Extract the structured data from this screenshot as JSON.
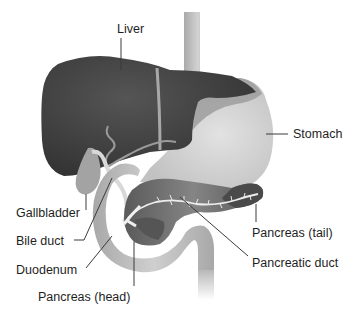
{
  "labels": {
    "liver": "Liver",
    "stomach": "Stomach",
    "gallbladder": "Gallbladder",
    "bile_duct": "Bile duct",
    "duodenum": "Duodenum",
    "pancreas_head": "Pancreas (head)",
    "pancreas_tail": "Pancreas (tail)",
    "pancreatic_duct": "Pancreatic duct"
  },
  "colors": {
    "liver": "#3d3d3d",
    "liver_highlight": "#4a4a4a",
    "stomach": "#d4d4d4",
    "stomach_upper": "#9a9a9a",
    "esophagus": "#bdbdbd",
    "duodenum": "#b5b5b5",
    "pancreas": "#7a7a7a",
    "pancreas_dark": "#4d4d4d",
    "duct": "#e8e8e8",
    "gallbladder": "#9e9e9e",
    "text": "#1e1e1e"
  }
}
